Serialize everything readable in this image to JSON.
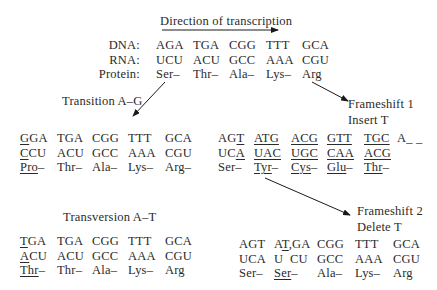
{
  "title": "Direction of transcription",
  "original": {
    "row_labels": [
      "DNA:",
      "RNA:",
      "Protein:"
    ],
    "dna": [
      "AGA",
      "TGA",
      "CGG",
      "TTT",
      "GCA"
    ],
    "rna": [
      "UCU",
      "ACU",
      "GCC",
      "AAA",
      "CGU"
    ],
    "protein": [
      "Ser–",
      "Thr–",
      "Ala–",
      "Lys–",
      "Arg"
    ]
  },
  "transition": {
    "label": "Transition A–G",
    "dna": [
      "GGA",
      "TGA",
      "CGG",
      "TTT",
      "GCA"
    ],
    "rna": [
      "CCU",
      "ACU",
      "GCC",
      "AAA",
      "CGU"
    ],
    "protein": [
      "Pro–",
      "Thr–",
      "Ala–",
      "Lys–",
      "Arg–"
    ],
    "underlined": {
      "dna0_first": "G",
      "dna0_rest": "GA",
      "rna0_first": "C",
      "rna0_rest": "CU"
    }
  },
  "frameshift1": {
    "label_line1": "Frameshift 1",
    "label_line2": "Insert T",
    "dna": [
      "AG",
      "T",
      "ATG",
      "ACG",
      "GTT",
      "TGC",
      "A_ _"
    ],
    "rna": [
      "UC",
      "A",
      "UAC",
      "UGC",
      "CAA",
      "ACG"
    ],
    "protein": [
      "Ser–",
      "Tyr–",
      "Cys–",
      "Glu–",
      "Thr–"
    ]
  },
  "transversion": {
    "label": "Transversion A–T",
    "dna": [
      "T",
      "GA",
      "TGA",
      "CGG",
      "TTT",
      "GCA"
    ],
    "rna": [
      "A",
      "CU",
      "ACU",
      "GCC",
      "AAA",
      "CGU"
    ],
    "protein": [
      "Thr",
      "–",
      "Thr–",
      "Ala–",
      "Lys–",
      "Arg"
    ]
  },
  "frameshift2": {
    "label_line1": "Frameshift 2",
    "label_line2": "Delete T",
    "dna": [
      "AGT",
      "A",
      "T",
      "GA",
      "CGG",
      "TTT",
      "GCA"
    ],
    "rna": [
      "UCA",
      "U  CU",
      "GCC",
      "AAA",
      "CGU"
    ],
    "protein": [
      "Ser–",
      "Ser",
      "–",
      "Ala–",
      "Lys–",
      "Arg"
    ]
  }
}
